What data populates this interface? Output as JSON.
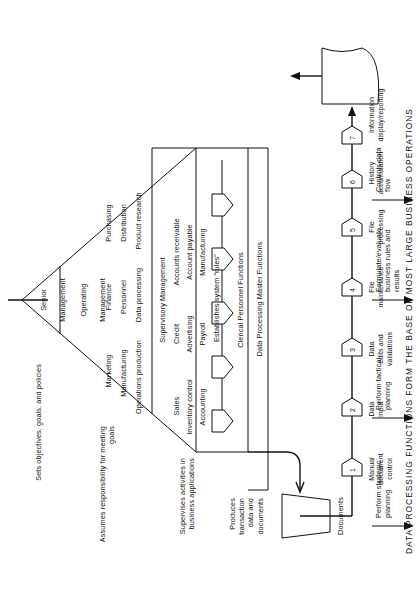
{
  "figure": {
    "caption": "DATA PROCESSING FUNCTIONS FORM THE BASE OF MOST LARGE BUSINESS OPERATIONS"
  },
  "pyramid": {
    "levels": [
      {
        "name": "Senior Management",
        "title_line1": "Senior",
        "title_line2": "Management"
      },
      {
        "name": "Operating Management",
        "title_line1": "Operating",
        "title_line2": "Management"
      },
      {
        "name": "Supervisory Management",
        "title": "Supervisory Management"
      }
    ],
    "operating_functions": [
      "Marketing",
      "Finance",
      "Purchasing",
      "Manufacturing",
      "Personnel",
      "Distribution",
      "Operations production",
      "Data processing",
      "Product research"
    ],
    "supervisory_functions": [
      "Sales",
      "Credit",
      "Accounts receivable",
      "Inventory control",
      "Advertising",
      "Account payable",
      "Accounting",
      "Payroll",
      "Manufacturing"
    ],
    "supervisory_note": "Establishes system “rules”"
  },
  "role_notes": [
    "Sets objectives, goals, and policies",
    "Assumes responsibility for meeting\ngoals",
    "Supervises activities in\nbusiness applications",
    "Produces\ntransaction\ndata and\ndocuments"
  ],
  "arrow_notes": [
    "Perform strategic\nplanning",
    "Perform tactical\nplanning",
    "Formulate/evaluate\nbusiness rules and\nresults",
    "Controls data\nflow"
  ],
  "bands": {
    "clerical": "Clerical Personnel Functions",
    "master": "Data Processing Master Functions"
  },
  "flow": {
    "source_label": "Documents",
    "output_label": "Information\ndisplay/reporting",
    "steps": [
      {
        "number": "1",
        "label": "Manual\ndocument\ncontrol"
      },
      {
        "number": "2",
        "label": "Data\ninput"
      },
      {
        "number": "3",
        "label": "Data\nedits and\nvalidations"
      },
      {
        "number": "4",
        "label": "File\nmaintenance"
      },
      {
        "number": "5",
        "label": "File\nprocessing"
      },
      {
        "number": "6",
        "label": "History\naccumulation"
      },
      {
        "number": "7",
        "label": ""
      }
    ]
  },
  "colors": {
    "ink": "#111111",
    "paper": "#ffffff"
  }
}
